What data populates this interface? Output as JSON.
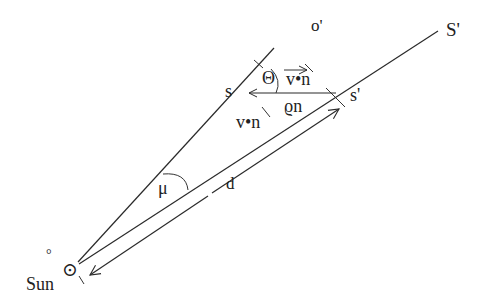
{
  "diagram": {
    "labels": {
      "o_prime": "o'",
      "S_prime": "S'",
      "s": "s",
      "s_prime": "s'",
      "theta": "Θ",
      "v_dot_n_top": "v•n",
      "rho_n": "ϱn",
      "v_dot_n_side": "v•n",
      "mu": "μ",
      "d": "d",
      "sun": "Sun",
      "sun_symbol": "⊙",
      "degree_mark": "°"
    },
    "colors": {
      "stroke": "#2a2a2a",
      "background": "#ffffff"
    }
  }
}
